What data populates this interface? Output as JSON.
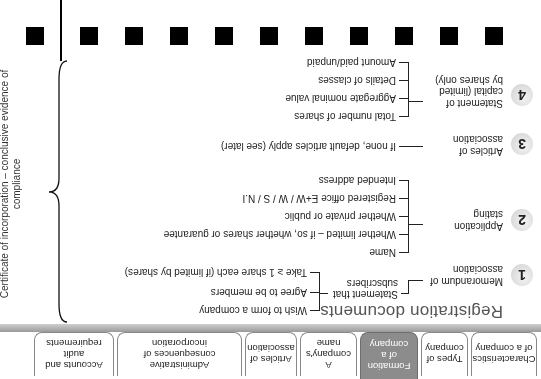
{
  "tabs": [
    {
      "label": "Characteristics of a company",
      "active": false
    },
    {
      "label": "Types of company",
      "active": false
    },
    {
      "label": "Formation of a company",
      "active": true
    },
    {
      "label": "A company's name",
      "active": false
    },
    {
      "label": "Articles of association",
      "active": false
    },
    {
      "label": "Administrative consequences of incorporation",
      "active": false
    },
    {
      "label": "Accounts and audit requirements",
      "active": false
    }
  ],
  "title": "Registration documents",
  "items": [
    {
      "number": "1",
      "label": "Memorandum of association",
      "sub": "Statement that subscribers",
      "leaves": [
        "Wish to form a company",
        "Agree to be members",
        "Take ≥ 1 share each (if limited by shares)"
      ]
    },
    {
      "number": "2",
      "label": "Application stating",
      "leaves": [
        "Name",
        "Whether limited – if so, whether shares or guarantee",
        "Whether private or public",
        "Registered office E+W / W / S / N.I",
        "Intended address"
      ]
    },
    {
      "number": "3",
      "label": "Articles of association",
      "leaves": [
        "If none, default articles apply (see later)"
      ]
    },
    {
      "number": "4",
      "label": "Statement of capital (limited by shares only)",
      "leaves": [
        "Total number of shares",
        "Aggregate nominal value",
        "Details of classes",
        "Amount paid/unpaid"
      ]
    }
  ],
  "side_note": "Certificate of incorporation – conclusive evidence of compliance",
  "colors": {
    "active_tab": "#8c8c8c",
    "tab_border": "#888888",
    "title": "#555555"
  }
}
